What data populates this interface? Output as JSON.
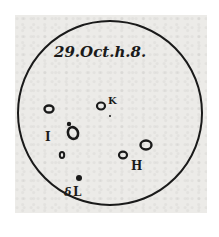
{
  "title": "29.Oct.h.8.",
  "colors": {
    "ink": "#1a1a1a",
    "paper": "#ecebe8",
    "background": "#ffffff"
  },
  "disk": {
    "cx": 110,
    "cy": 113,
    "r": 92
  },
  "spots": [
    {
      "label": "K",
      "x": 101,
      "y": 105,
      "label_x": 108,
      "label_y": 104
    },
    {
      "label": "I",
      "x": 48,
      "y": 109,
      "label_x": 46,
      "label_y": 141
    },
    {
      "label": "",
      "x": 72,
      "y": 132,
      "label_x": 0,
      "label_y": 0
    },
    {
      "label": "",
      "x": 62,
      "y": 156,
      "label_x": 0,
      "label_y": 0
    },
    {
      "label": "H",
      "x": 123,
      "y": 155,
      "label_x": 130,
      "label_y": 170
    },
    {
      "label": "",
      "x": 146,
      "y": 145,
      "label_x": 0,
      "label_y": 0
    },
    {
      "label": "L",
      "x": 78,
      "y": 178,
      "label_x": 73,
      "label_y": 196
    }
  ],
  "labels": {
    "k": "K",
    "i": "I",
    "h": "H",
    "l": "L",
    "l_prefix": "δ"
  }
}
